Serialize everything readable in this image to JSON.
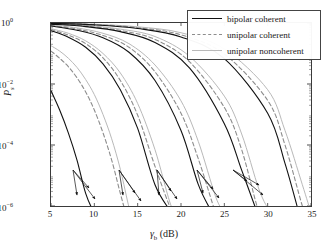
{
  "chart_data": {
    "type": "line",
    "title": "",
    "xlabel": "γb (dB)",
    "ylabel": "Ps",
    "xlim": [
      5,
      35
    ],
    "ylim": [
      1e-06,
      1
    ],
    "yscale": "log",
    "grid": false,
    "xticks": [
      5,
      10,
      15,
      20,
      25,
      30,
      35
    ],
    "xtick_labels": [
      "5",
      "10",
      "15",
      "20",
      "25",
      "30",
      "35"
    ],
    "yticks": [
      1,
      0.01,
      0.0001,
      1e-06
    ],
    "ytick_labels": [
      "10⁰",
      "10⁻²",
      "10⁻⁴",
      "10⁻⁶"
    ],
    "legend_position": "top-right",
    "legend": [
      {
        "label": "bipolar coherent",
        "style": "solid",
        "color": "#111111"
      },
      {
        "label": "unipolar coherent",
        "style": "dashed",
        "color": "#8d8d8d"
      },
      {
        "label": "unipolar noncoherent",
        "style": "solid",
        "color": "#b9b9b9"
      }
    ],
    "annotations": [
      {
        "text": "M = 2",
        "x": 10.0,
        "y": 0.00012
      },
      {
        "text": "4",
        "x": 15.2,
        "y": 0.00014
      },
      {
        "text": "8",
        "x": 20.3,
        "y": 0.00014
      },
      {
        "text": "16",
        "x": 24.9,
        "y": 0.00014
      },
      {
        "text": "32",
        "x": 29.6,
        "y": 0.00014
      }
    ],
    "series": [
      {
        "name": "bipolar coherent M=2",
        "M": 2,
        "scheme": "bipolar coherent",
        "x": [
          5,
          6,
          7,
          8,
          9,
          10,
          10.3
        ],
        "y": [
          0.006,
          0.0014,
          0.00025,
          3.2e-05,
          2.6e-06,
          1e-07,
          1e-08
        ]
      },
      {
        "name": "unipolar coherent M=2",
        "M": 2,
        "scheme": "unipolar coherent",
        "x": [
          5,
          6,
          7,
          8,
          9,
          10,
          11,
          12,
          13,
          13.6
        ],
        "y": [
          0.12,
          0.07,
          0.037,
          0.016,
          0.0055,
          0.0014,
          0.00025,
          3.2e-05,
          2.6e-06,
          4e-07
        ]
      },
      {
        "name": "unipolar noncoherent M=2",
        "M": 2,
        "scheme": "unipolar noncoherent",
        "x": [
          5,
          6,
          7,
          8,
          9,
          10,
          11,
          12,
          13,
          14,
          14.3
        ],
        "y": [
          0.18,
          0.12,
          0.07,
          0.035,
          0.014,
          0.0045,
          0.001,
          0.00016,
          1.6e-05,
          9e-07,
          3e-07
        ]
      },
      {
        "name": "bipolar coherent M=4",
        "M": 4,
        "scheme": "bipolar coherent",
        "x": [
          5,
          7,
          9,
          11,
          13,
          15,
          17,
          18.9
        ],
        "y": [
          0.56,
          0.34,
          0.16,
          0.046,
          0.0065,
          0.00035,
          5e-06,
          1e-07
        ]
      },
      {
        "name": "unipolar coherent M=4",
        "M": 4,
        "scheme": "unipolar coherent",
        "x": [
          5,
          7,
          9,
          11,
          13,
          15,
          17,
          19,
          19.5
        ],
        "y": [
          0.6,
          0.4,
          0.21,
          0.072,
          0.013,
          0.00095,
          2e-05,
          1.5e-07,
          3e-08
        ]
      },
      {
        "name": "unipolar noncoherent M=4",
        "M": 4,
        "scheme": "unipolar noncoherent",
        "x": [
          5,
          7,
          9,
          11,
          13,
          15,
          17,
          19,
          20.2
        ],
        "y": [
          0.65,
          0.46,
          0.26,
          0.1,
          0.023,
          0.0023,
          7e-05,
          8e-07,
          4e-08
        ]
      },
      {
        "name": "bipolar coherent M=8",
        "M": 8,
        "scheme": "bipolar coherent",
        "x": [
          5,
          8,
          11,
          14,
          17,
          20,
          22,
          23.6
        ],
        "y": [
          0.8,
          0.58,
          0.33,
          0.11,
          0.013,
          0.0003,
          5e-06,
          1e-07
        ]
      },
      {
        "name": "unipolar coherent M=8",
        "M": 8,
        "scheme": "unipolar coherent",
        "x": [
          5,
          8,
          11,
          14,
          17,
          20,
          22,
          24,
          24.4
        ],
        "y": [
          0.83,
          0.63,
          0.39,
          0.16,
          0.025,
          0.0011,
          3.5e-05,
          3e-07,
          8e-08
        ]
      },
      {
        "name": "unipolar noncoherent M=8",
        "M": 8,
        "scheme": "unipolar noncoherent",
        "x": [
          5,
          8,
          11,
          14,
          17,
          20,
          22,
          24,
          25.0
        ],
        "y": [
          0.86,
          0.69,
          0.46,
          0.21,
          0.042,
          0.0028,
          0.00013,
          2e-06,
          1.5e-07
        ]
      },
      {
        "name": "bipolar coherent M=16",
        "M": 16,
        "scheme": "bipolar coherent",
        "x": [
          5,
          9,
          13,
          17,
          21,
          25,
          27,
          28.8
        ],
        "y": [
          0.92,
          0.76,
          0.52,
          0.23,
          0.033,
          0.0005,
          1.5e-05,
          1e-07
        ]
      },
      {
        "name": "unipolar coherent M=16",
        "M": 16,
        "scheme": "unipolar coherent",
        "x": [
          5,
          9,
          13,
          17,
          21,
          25,
          27,
          29,
          29.6
        ],
        "y": [
          0.93,
          0.79,
          0.57,
          0.29,
          0.053,
          0.0017,
          7e-05,
          6e-07,
          1.2e-07
        ]
      },
      {
        "name": "unipolar noncoherent M=16",
        "M": 16,
        "scheme": "unipolar noncoherent",
        "x": [
          5,
          9,
          13,
          17,
          21,
          25,
          27,
          29,
          30.3
        ],
        "y": [
          0.94,
          0.83,
          0.63,
          0.36,
          0.08,
          0.004,
          0.00023,
          3.5e-06,
          2e-07
        ]
      },
      {
        "name": "bipolar coherent M=32",
        "M": 32,
        "scheme": "bipolar coherent",
        "x": [
          5,
          10,
          15,
          20,
          25,
          30,
          32,
          33.6
        ],
        "y": [
          0.97,
          0.87,
          0.66,
          0.35,
          0.068,
          0.0011,
          2.5e-05,
          2e-07
        ]
      },
      {
        "name": "unipolar coherent M=32",
        "M": 32,
        "scheme": "unipolar coherent",
        "x": [
          5,
          10,
          15,
          20,
          25,
          30,
          32,
          34,
          34.4
        ],
        "y": [
          0.97,
          0.89,
          0.7,
          0.41,
          0.096,
          0.0029,
          0.0001,
          1e-06,
          3e-07
        ]
      },
      {
        "name": "unipolar noncoherent M=32",
        "M": 32,
        "scheme": "unipolar noncoherent",
        "x": [
          5,
          10,
          15,
          20,
          25,
          30,
          32,
          34,
          35.0
        ],
        "y": [
          0.98,
          0.91,
          0.75,
          0.48,
          0.14,
          0.0065,
          0.0003,
          5e-06,
          6e-07
        ]
      }
    ]
  },
  "axes": {
    "ylabel": "P",
    "ylabel_sub": "s",
    "xlabel_gamma": "γ",
    "xlabel_sub": "b",
    "xlabel_unit": "(dB)"
  }
}
